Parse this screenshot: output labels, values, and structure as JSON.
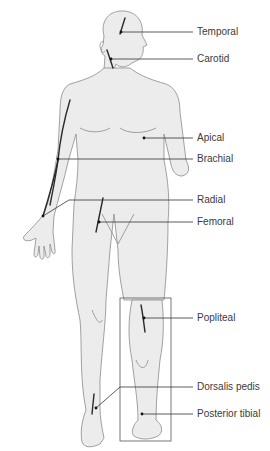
{
  "figure": {
    "colors": {
      "body_fill": "#ececec",
      "body_outline": "#8a8a8a",
      "artery": "#2a2a2a",
      "leader": "#333333",
      "label_text": "#3a3a3a",
      "inset_box": "#555555"
    },
    "labels": [
      {
        "id": "temporal",
        "text": "Temporal",
        "y": 32,
        "dot": [
          121,
          32
        ]
      },
      {
        "id": "carotid",
        "text": "Carotid",
        "y": 59,
        "dot": [
          111,
          59
        ]
      },
      {
        "id": "apical",
        "text": "Apical",
        "y": 138,
        "dot": [
          144,
          138
        ]
      },
      {
        "id": "brachial",
        "text": "Brachial",
        "y": 159,
        "dot": [
          58,
          159
        ]
      },
      {
        "id": "radial",
        "text": "Radial",
        "y": 200,
        "dot": [
          43,
          216
        ]
      },
      {
        "id": "femoral",
        "text": "Femoral",
        "y": 222,
        "dot": [
          99,
          222
        ]
      },
      {
        "id": "popliteal",
        "text": "Popliteal",
        "y": 318,
        "dot": [
          144,
          318
        ]
      },
      {
        "id": "dorsalis-pedis",
        "text": "Dorsalis pedis",
        "y": 387,
        "dot": [
          96,
          408
        ]
      },
      {
        "id": "posterior-tibial",
        "text": "Posterior tibial",
        "y": 414,
        "dot": [
          142,
          414
        ]
      }
    ],
    "inset": {
      "description": "Posterior view of lower leg",
      "x": 120,
      "y": 298,
      "width": 51,
      "height": 143
    }
  }
}
